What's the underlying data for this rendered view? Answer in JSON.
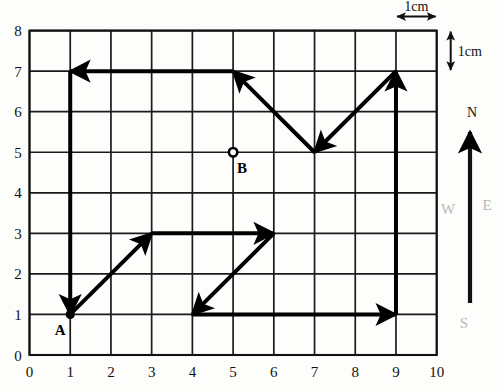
{
  "figure": {
    "background_color": "#fdfdfb",
    "grid_line_color": "#1a1a1a",
    "route_color": "#000000"
  },
  "axes": {
    "x_ticks": [
      "0",
      "1",
      "2",
      "3",
      "4",
      "5",
      "6",
      "7",
      "8",
      "9",
      "10"
    ],
    "y_ticks": [
      "0",
      "1",
      "2",
      "3",
      "4",
      "5",
      "6",
      "7",
      "8"
    ],
    "x_min": 0,
    "x_max": 10,
    "y_min": 0,
    "y_max": 8
  },
  "scale": {
    "horizontal_label": "1cm",
    "vertical_label": "1cm",
    "horizontal_span_x": [
      9,
      10
    ],
    "horizontal_span_y": 8,
    "vertical_span_y": [
      7,
      8
    ],
    "vertical_span_x": 10
  },
  "points": [
    {
      "id": "A",
      "label": "A",
      "x": 1,
      "y": 1,
      "marker": "filled-dot"
    },
    {
      "id": "B",
      "label": "B",
      "x": 5,
      "y": 5,
      "marker": "open-dot"
    }
  ],
  "route_segments": [
    {
      "name": "a-to-3-3",
      "from": [
        1,
        1
      ],
      "to": [
        3,
        3
      ],
      "arrow": "end"
    },
    {
      "name": "3-3-to-6-3",
      "from": [
        3,
        3
      ],
      "to": [
        6,
        3
      ],
      "arrow": "end"
    },
    {
      "name": "6-3-to-4-1",
      "from": [
        6,
        3
      ],
      "to": [
        4,
        1
      ],
      "arrow": "end"
    },
    {
      "name": "4-1-to-9-1",
      "from": [
        4,
        1
      ],
      "to": [
        9,
        1
      ],
      "arrow": "end"
    },
    {
      "name": "9-1-to-9-7",
      "from": [
        9,
        1
      ],
      "to": [
        9,
        7
      ],
      "arrow": "end"
    },
    {
      "name": "9-7-to-7-5",
      "from": [
        9,
        7
      ],
      "to": [
        7,
        5
      ],
      "arrow": "end"
    },
    {
      "name": "7-5-to-5-7",
      "from": [
        7,
        5
      ],
      "to": [
        5,
        7
      ],
      "arrow": "end"
    },
    {
      "name": "5-7-to-1-7",
      "from": [
        5,
        7
      ],
      "to": [
        1,
        7
      ],
      "arrow": "end"
    },
    {
      "name": "1-7-to-1-1",
      "from": [
        1,
        7
      ],
      "to": [
        1,
        1
      ],
      "arrow": "end"
    }
  ],
  "compass": {
    "north_label": "N",
    "west_label": "W",
    "east_label": "E",
    "south_label": "S",
    "faint_color": "#b9b9b9"
  }
}
